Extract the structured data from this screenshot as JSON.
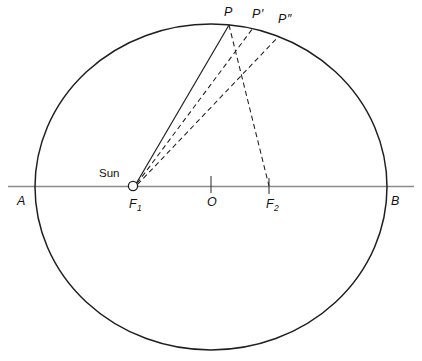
{
  "figure": {
    "type": "geometric-diagram",
    "background_color": "#ffffff",
    "stroke_color": "#1a1a1a",
    "axis_color": "#808080"
  },
  "labels": {
    "sun": "Sun",
    "vertex_a": "A",
    "vertex_b": "B",
    "center": "O",
    "focus_1": "F",
    "focus_1_sub": "1",
    "focus_2": "F",
    "focus_2_sub": "2",
    "point_p": "P",
    "point_p_prime": "P",
    "point_p_prime_mark": "′",
    "point_p_dprime": "P",
    "point_p_dprime_mark": "″"
  },
  "geometry": {
    "ellipse": {
      "cx": 211,
      "cy": 187,
      "rx": 176,
      "ry": 163
    },
    "major_axis": {
      "x1": 8,
      "y1": 187,
      "x2": 414,
      "y2": 187
    },
    "sun_marker": {
      "cx": 133,
      "cy": 186,
      "r": 4.5
    },
    "focus_1": {
      "x": 133,
      "y": 186
    },
    "focus_2": {
      "x": 269,
      "y": 186
    },
    "center_tick": {
      "x": 211,
      "y": 186
    },
    "point_p": {
      "x": 229,
      "y": 25
    },
    "point_p_prime": {
      "x": 253,
      "y": 28
    },
    "point_p_dprime": {
      "x": 279,
      "y": 36
    }
  },
  "label_positions": {
    "sun": {
      "x": 99,
      "y": 176
    },
    "vertex_a": {
      "x": 17,
      "y": 204
    },
    "vertex_b": {
      "x": 391,
      "y": 204
    },
    "center": {
      "x": 208,
      "y": 205
    },
    "focus_1": {
      "x": 129,
      "y": 207
    },
    "focus_2": {
      "x": 267,
      "y": 207
    },
    "point_p": {
      "x": 225,
      "y": 15
    },
    "point_p_prime": {
      "x": 253,
      "y": 17
    },
    "point_p_dprime": {
      "x": 279,
      "y": 22
    }
  }
}
